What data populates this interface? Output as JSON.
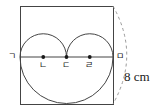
{
  "figure": {
    "stroke_color": "#444444",
    "dash_color": "#9a9a9a",
    "point_color": "#1a1a1a",
    "background_color": "#ffffff",
    "square": {
      "name": "bounding-square",
      "left": 20,
      "top": 6,
      "side": 93
    },
    "diameter_line": {
      "name": "horizontal-diameter",
      "x1": 20,
      "x2": 113,
      "y": 57
    },
    "upper_arcs": [
      {
        "name": "left-semicircle",
        "cx": 43.25,
        "cy": 57,
        "r": 23.25
      },
      {
        "name": "right-semicircle",
        "cx": 89.75,
        "cy": 57,
        "r": 23.25
      }
    ],
    "lower_arc": {
      "name": "lower-semicircle",
      "cx": 66.5,
      "cy": 57,
      "r": 46.5
    },
    "dashed_arc": {
      "name": "side-length-arc",
      "x1": 113,
      "y1": 6,
      "x2": 113,
      "y2": 104,
      "bulge": 22
    },
    "points": [
      {
        "id": "g",
        "label": "ㄱ",
        "cx": 20,
        "cy": 57,
        "dot": false,
        "label_x": 8,
        "label_y": 52
      },
      {
        "id": "n",
        "label": "ㄴ",
        "cx": 43.25,
        "cy": 57,
        "dot": true,
        "label_x": 39,
        "label_y": 61
      },
      {
        "id": "d",
        "label": "ㄷ",
        "cx": 66.5,
        "cy": 57,
        "dot": true,
        "label_x": 62,
        "label_y": 61
      },
      {
        "id": "r",
        "label": "ㄹ",
        "cx": 89.75,
        "cy": 57,
        "dot": true,
        "label_x": 85,
        "label_y": 61
      },
      {
        "id": "m",
        "label": "ㅁ",
        "cx": 113,
        "cy": 57,
        "dot": false,
        "label_x": 116,
        "label_y": 52
      }
    ],
    "dimension": {
      "name": "side-length-dimension",
      "value": "8",
      "unit": "cm",
      "text": "8 cm",
      "label_x": 124,
      "label_y": 70
    }
  }
}
